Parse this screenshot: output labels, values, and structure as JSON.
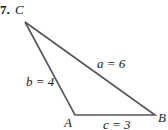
{
  "problem": {
    "number": "7."
  },
  "vertices": {
    "A": {
      "label": "A",
      "x": 75,
      "y": 115
    },
    "B": {
      "label": "B",
      "x": 155,
      "y": 115
    },
    "C": {
      "label": "C",
      "x": 25,
      "y": 22
    }
  },
  "sides": {
    "a": {
      "label": "a = 6"
    },
    "b": {
      "label": "b = 4"
    },
    "c": {
      "label": "c = 3"
    }
  },
  "colors": {
    "line": "#555555",
    "text": "#222222"
  }
}
